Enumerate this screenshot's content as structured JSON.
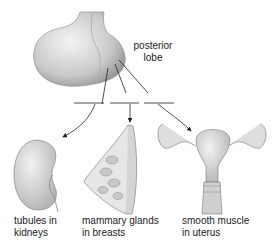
{
  "diagram": {
    "source_label": {
      "line1": "posterior",
      "line2": "lobe"
    },
    "targets": [
      {
        "line1": "tubules in",
        "line2": "kidneys"
      },
      {
        "line1": "mammary glands",
        "line2": "in breasts"
      },
      {
        "line1": "smooth muscle",
        "line2": "in uterus"
      }
    ]
  }
}
